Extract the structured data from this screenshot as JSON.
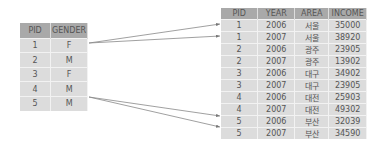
{
  "left_table": {
    "headers": [
      "PID",
      "GENDER"
    ],
    "rows": [
      [
        "1",
        "F"
      ],
      [
        "2",
        "M"
      ],
      [
        "3",
        "F"
      ],
      [
        "4",
        "M"
      ],
      [
        "5",
        "M"
      ]
    ],
    "row_heights": [
      14,
      15,
      14,
      15,
      14
    ]
  },
  "right_table": {
    "headers": [
      "PID",
      "YEAR",
      "AREA",
      "INCOME"
    ],
    "rows": [
      [
        "1",
        "2006",
        "서울",
        "35000"
      ],
      [
        "1",
        "2007",
        "서울",
        "38920"
      ],
      [
        "2",
        "2006",
        "광주",
        "23905"
      ],
      [
        "2",
        "2007",
        "광주",
        "13902"
      ],
      [
        "3",
        "2006",
        "대구",
        "34902"
      ],
      [
        "3",
        "2007",
        "대구",
        "23905"
      ],
      [
        "4",
        "2006",
        "대전",
        "25903"
      ],
      [
        "4",
        "2007",
        "대전",
        "49302"
      ],
      [
        "5",
        "2006",
        "부산",
        "32039"
      ],
      [
        "5",
        "2007",
        "부산",
        "34590"
      ]
    ]
  },
  "arrows": [
    {
      "from": "left.row1",
      "to": "right.row1"
    },
    {
      "from": "left.row1",
      "to": "right.row2"
    },
    {
      "from": "left.row5",
      "to": "right.row9"
    },
    {
      "from": "left.row5",
      "to": "right.row10"
    }
  ],
  "colors": {
    "header": "#a9a9a9",
    "cell": "#dcdcdc",
    "arrow": "#777777"
  }
}
